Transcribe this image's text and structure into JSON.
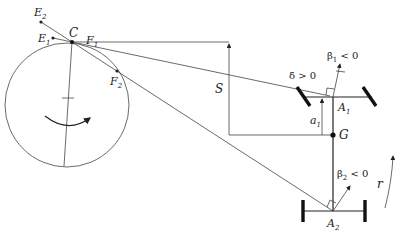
{
  "figure": {
    "type": "vehicle path-tracking geometry diagram",
    "labels": {
      "E2": "E",
      "E2_sub": "2",
      "E1": "E",
      "E1_sub": "1",
      "C": "C",
      "F1": "F",
      "F1_sub": "1",
      "F2": "F",
      "F2_sub": "2",
      "S": "S",
      "delta_dot": "δ̇ > 0",
      "beta1_dot": "β̇",
      "beta1_sub": "1",
      "beta1_rel": " < 0",
      "beta2_dot": "β̇",
      "beta2_sub": "2",
      "beta2_rel": " < 0",
      "A1": "A",
      "A1_sub": "1",
      "A2": "A",
      "A2_sub": "2",
      "a1": "a",
      "a1_sub": "1",
      "G": "G",
      "r": "r"
    },
    "colors": {
      "line": "#444444",
      "axle": "#111111",
      "background": "#ffffff"
    }
  }
}
